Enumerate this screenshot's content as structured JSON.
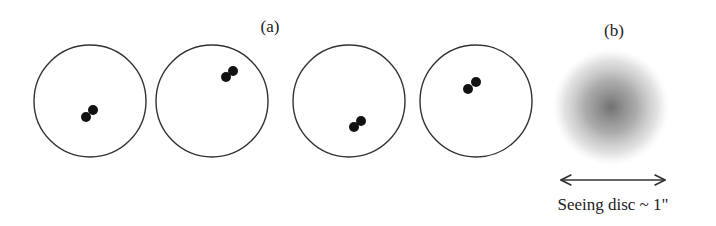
{
  "panel_a": {
    "label": "(a)",
    "frames": [
      {
        "cx": 90,
        "cy": 101,
        "r": 56,
        "dots": [
          [
            86,
            117
          ],
          [
            93,
            110
          ]
        ]
      },
      {
        "cx": 212,
        "cy": 101,
        "r": 56,
        "dots": [
          [
            226,
            77
          ],
          [
            233,
            71
          ]
        ]
      },
      {
        "cx": 349,
        "cy": 101,
        "r": 56,
        "dots": [
          [
            354,
            127
          ],
          [
            361,
            121
          ]
        ]
      },
      {
        "cx": 476,
        "cy": 101,
        "r": 56,
        "dots": [
          [
            468,
            89
          ],
          [
            476,
            82
          ]
        ]
      }
    ]
  },
  "panel_b": {
    "label": "(b)",
    "caption": "Seeing disc ~ 1\""
  },
  "colors": {
    "stroke": "#333333",
    "dot": "#111111",
    "blur": "#555555"
  }
}
